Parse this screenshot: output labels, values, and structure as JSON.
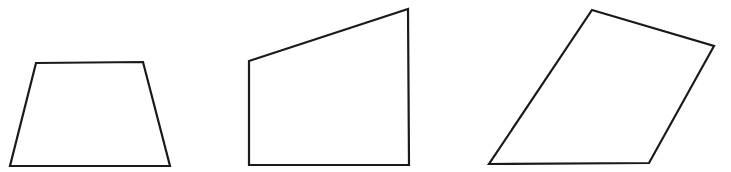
{
  "figure": {
    "width": 731,
    "height": 172,
    "background": "#ffffff",
    "stroke_color": "#1a1a1a",
    "stroke_width": 2.2,
    "shapes": [
      {
        "name": "quadrilateral-trapezoid",
        "type": "isosceles-trapezoid",
        "points": "36,63 143,62 170,166 10,166"
      },
      {
        "name": "quadrilateral-right-trapezoid",
        "type": "right-trapezoid",
        "points": "249,61 408,9 409,165 249,165"
      },
      {
        "name": "quadrilateral-irregular",
        "type": "irregular-quadrilateral",
        "points": "592,10 714,46 649,163 489,164"
      }
    ]
  }
}
